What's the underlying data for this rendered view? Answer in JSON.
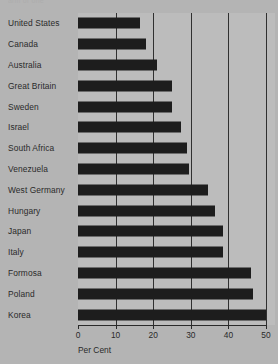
{
  "top_partial_text": "arm or one",
  "colors": {
    "page_background": "#b4b4b4",
    "plot_background": "#bcbcbc",
    "bar": "#1d1d1d",
    "gridline": "#303030",
    "text": "#2a2a2a"
  },
  "chart_data": {
    "type": "bar",
    "orientation": "horizontal",
    "title": "",
    "xlabel": "Per Cent",
    "ylabel": "",
    "xlim": [
      0,
      50
    ],
    "xticks": [
      0,
      10,
      20,
      30,
      40,
      50
    ],
    "xtick_labels": [
      "0",
      "10",
      "20",
      "30",
      "40",
      "50"
    ],
    "grid": true,
    "grid_axis": "x",
    "legend": false,
    "categories": [
      "United States",
      "Canada",
      "Australia",
      "Great Britain",
      "Sweden",
      "Israel",
      "South Africa",
      "Venezuela",
      "West Germany",
      "Hungary",
      "Japan",
      "Italy",
      "Formosa",
      "Poland",
      "Korea"
    ],
    "values": [
      16.5,
      18,
      21,
      25,
      25,
      27.5,
      29,
      29.5,
      34.5,
      36.5,
      38.5,
      38.5,
      46,
      46.5,
      50
    ]
  }
}
